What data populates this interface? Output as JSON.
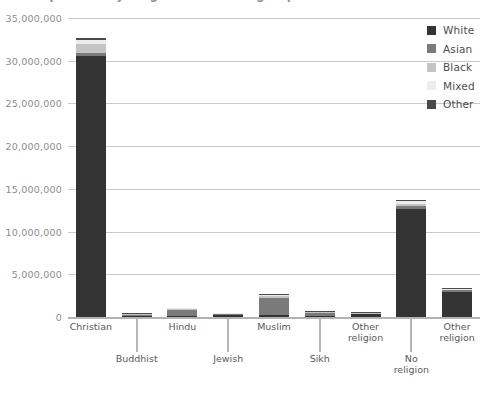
{
  "title": "Population by religion and ethnic group",
  "legend": {
    "position": "top-right",
    "entries": [
      {
        "label": "White",
        "color": "#333333"
      },
      {
        "label": "Asian",
        "color": "#7a7a7a"
      },
      {
        "label": "Black",
        "color": "#c4c4c4"
      },
      {
        "label": "Mixed",
        "color": "#ececec"
      },
      {
        "label": "Other",
        "color": "#4a4a4a"
      }
    ]
  },
  "axes": {
    "y": {
      "min": 0,
      "max": 35000000,
      "step": 5000000,
      "ticks": [
        "0",
        "5,000,000",
        "10,000,000",
        "15,000,000",
        "20,000,000",
        "25,000,000",
        "30,000,000",
        "35,000,000"
      ]
    },
    "x": {
      "label": ""
    }
  },
  "chart_data": {
    "type": "bar",
    "stacked": true,
    "title": "Population by religion and ethnic group",
    "xlabel": "",
    "ylabel": "",
    "ylim": [
      0,
      35000000
    ],
    "grid": true,
    "legend_position": "top-right",
    "categories": [
      "Christian",
      "Buddhist",
      "Hindu",
      "Jewish",
      "Muslim",
      "Sikh",
      "Other religion",
      "No religion",
      "Other religion"
    ],
    "series": [
      {
        "name": "White",
        "color": "#333333",
        "values": [
          30500000,
          80000,
          60000,
          250000,
          280000,
          20000,
          300000,
          12700000,
          2950000
        ]
      },
      {
        "name": "Asian",
        "color": "#7a7a7a",
        "values": [
          400000,
          160000,
          800000,
          10000,
          1900000,
          410000,
          50000,
          320000,
          180000
        ]
      },
      {
        "name": "Black",
        "color": "#c4c4c4",
        "values": [
          1100000,
          10000,
          10000,
          5000,
          280000,
          5000,
          25000,
          180000,
          90000
        ]
      },
      {
        "name": "Mixed",
        "color": "#ececec",
        "values": [
          450000,
          15000,
          20000,
          15000,
          110000,
          10000,
          40000,
          330000,
          110000
        ]
      },
      {
        "name": "Other",
        "color": "#4a4a4a",
        "values": [
          200000,
          10000,
          15000,
          5000,
          130000,
          5000,
          20000,
          150000,
          70000
        ]
      }
    ],
    "totals": [
      32650000,
      275000,
      905000,
      285000,
      2700000,
      450000,
      435000,
      13680000,
      3400000
    ]
  }
}
